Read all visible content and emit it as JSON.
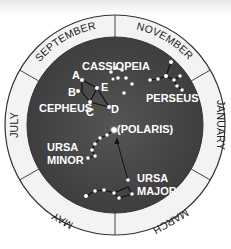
{
  "diagram": {
    "type": "star-chart",
    "colors": {
      "ring": "#f2f2f2",
      "ring_stroke": "#333333",
      "sky": "#4a4a4a",
      "star": "#ffffff",
      "text": "#ffffff"
    },
    "months": [
      {
        "label": "SEPTEMBER",
        "position": "upper-left"
      },
      {
        "label": "NOVEMBER",
        "position": "upper-right"
      },
      {
        "label": "JANUARY",
        "position": "right"
      },
      {
        "label": "MARCH",
        "position": "lower-right"
      },
      {
        "label": "MAY",
        "position": "lower-left"
      },
      {
        "label": "JULY",
        "position": "left"
      }
    ],
    "constellations": {
      "cassiopeia": "CASSIOPEIA",
      "perseus": "PERSEUS",
      "cepheus": "CEPHEUS",
      "ursa_minor": [
        "URSA",
        "MINOR"
      ],
      "ursa_major": [
        "URSA",
        "MAJOR"
      ],
      "polaris": "(POLARIS)"
    },
    "cepheus_points": [
      "A",
      "B",
      "C",
      "D",
      "E"
    ]
  }
}
